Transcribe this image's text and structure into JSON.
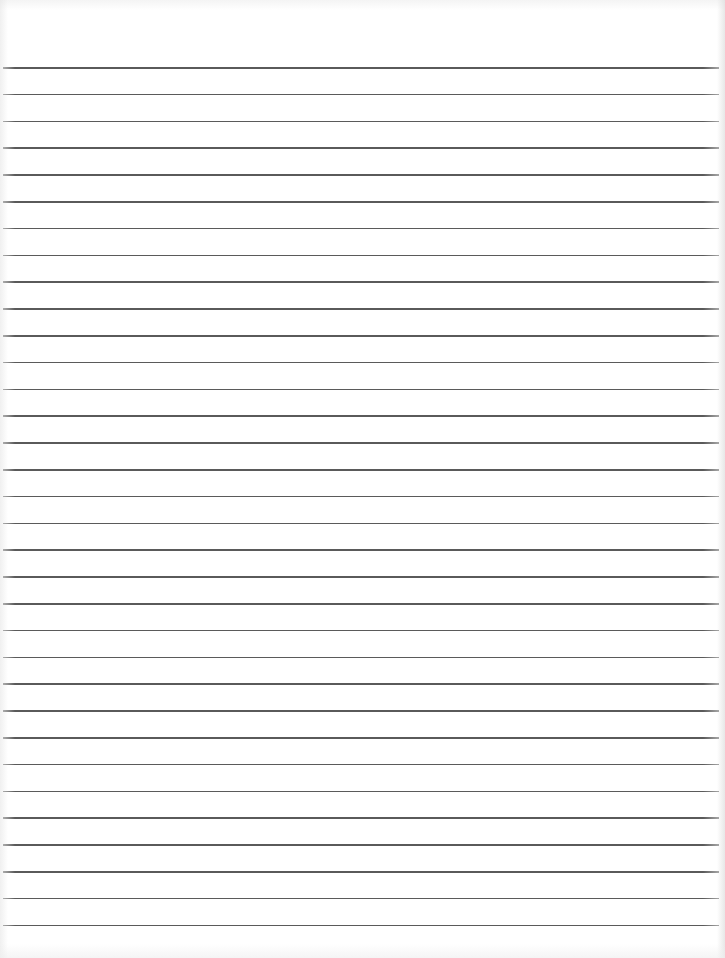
{
  "page": {
    "type": "lined-paper",
    "width": 725,
    "height": 958,
    "background_color": "#ffffff",
    "rule_color": "#5a5a5a"
  },
  "rules": {
    "count": 33,
    "first_y": 67,
    "spacing": 26.8,
    "left": 3,
    "width": 716
  }
}
